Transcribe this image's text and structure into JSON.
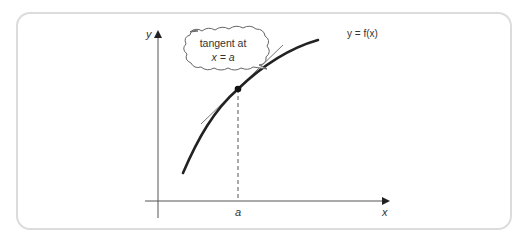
{
  "diagram": {
    "y_axis_label": "y",
    "x_axis_label": "x",
    "curve_label": "y = f(x)",
    "point_label": "a",
    "callout": {
      "line1": "tangent at",
      "line2": "x = a"
    },
    "colors": {
      "frame_border": "#dcdcdc",
      "axis": "#555555",
      "curve": "#222222",
      "tangent": "#555555",
      "text": "#333333"
    }
  }
}
